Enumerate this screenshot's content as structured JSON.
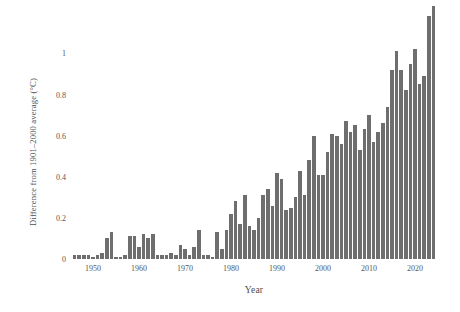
{
  "chart_data": {
    "type": "bar",
    "title": "",
    "subtitle": "",
    "xlabel": "Year",
    "ylabel": "Difference from 1901–2000 average (°C)",
    "xlim": [
      1945,
      2025
    ],
    "ylim": [
      0,
      1.25
    ],
    "grid": false,
    "legend": null,
    "bar_color": "#6e6e6e",
    "background_color": "#ffffff",
    "xticks": [
      1950,
      1960,
      1970,
      1980,
      1990,
      2000,
      2010,
      2020
    ],
    "xticklabels": [
      "1950",
      "1960",
      "1970",
      "1980",
      "1990",
      "2000",
      "2010",
      "2020"
    ],
    "yticks": [
      0,
      0.2,
      0.4,
      0.6,
      0.8,
      1
    ],
    "yticklabels": [
      "0",
      "0.2",
      "0.4",
      "0.6",
      "0.8",
      "1"
    ],
    "categories": [
      1946,
      1947,
      1948,
      1949,
      1950,
      1951,
      1952,
      1953,
      1954,
      1955,
      1956,
      1957,
      1958,
      1959,
      1960,
      1961,
      1962,
      1963,
      1964,
      1965,
      1966,
      1967,
      1968,
      1969,
      1970,
      1971,
      1972,
      1973,
      1974,
      1975,
      1976,
      1977,
      1978,
      1979,
      1980,
      1981,
      1982,
      1983,
      1984,
      1985,
      1986,
      1987,
      1988,
      1989,
      1990,
      1991,
      1992,
      1993,
      1994,
      1995,
      1996,
      1997,
      1998,
      1999,
      2000,
      2001,
      2002,
      2003,
      2004,
      2005,
      2006,
      2007,
      2008,
      2009,
      2010,
      2011,
      2012,
      2013,
      2014,
      2015,
      2016,
      2017,
      2018,
      2019,
      2020,
      2021,
      2022,
      2023,
      2024
    ],
    "values": [
      0.02,
      0.02,
      0.02,
      0.02,
      0.01,
      0.02,
      0.03,
      0.1,
      0.13,
      0.01,
      0.01,
      0.02,
      0.11,
      0.11,
      0.06,
      0.12,
      0.1,
      0.12,
      0.02,
      0.02,
      0.02,
      0.03,
      0.02,
      0.07,
      0.05,
      0.02,
      0.06,
      0.14,
      0.02,
      0.02,
      0.01,
      0.13,
      0.05,
      0.14,
      0.22,
      0.28,
      0.17,
      0.31,
      0.16,
      0.14,
      0.2,
      0.31,
      0.34,
      0.26,
      0.42,
      0.39,
      0.24,
      0.25,
      0.3,
      0.43,
      0.31,
      0.48,
      0.6,
      0.41,
      0.41,
      0.52,
      0.61,
      0.6,
      0.56,
      0.67,
      0.62,
      0.65,
      0.53,
      0.63,
      0.7,
      0.57,
      0.62,
      0.66,
      0.74,
      0.92,
      1.01,
      0.92,
      0.82,
      0.95,
      1.02,
      0.85,
      0.89,
      1.18,
      1.23
    ]
  }
}
